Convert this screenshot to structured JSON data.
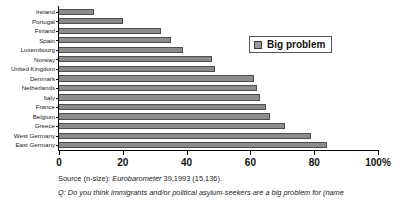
{
  "chart_data": {
    "type": "bar",
    "orientation": "horizontal",
    "title": "",
    "xlabel": "",
    "ylabel": "",
    "xlim": [
      0,
      100
    ],
    "xticks": [
      "0",
      "20",
      "40",
      "60",
      "80",
      "100%"
    ],
    "xtick_values": [
      0,
      20,
      40,
      60,
      80,
      100
    ],
    "grid": false,
    "legend_position": "upper right",
    "categories": [
      "Ireland",
      "Portugal",
      "Finland",
      "Spain",
      "Luxembourg",
      "Norway",
      "United Kingdom",
      "Denmark",
      "Netherlands",
      "Italy",
      "France",
      "Belgium",
      "Greece",
      "West Germany",
      "East Germany"
    ],
    "series": [
      {
        "name": "Big problem",
        "color": "#8c8c8c",
        "values": [
          11,
          20,
          32,
          35,
          39,
          48,
          49,
          61,
          62,
          63,
          65,
          66,
          71,
          79,
          84
        ]
      }
    ]
  },
  "legend": {
    "label": "Big problem",
    "swatch_color": "#9a9a9a"
  },
  "footer": {
    "source_prefix": "Source (n-size):",
    "source_italic": "Eurobarometer",
    "source_suffix": "39,1993 (15,136).",
    "source_full": "Source (n-size): Eurobarometer 39,1993 (15,136).",
    "question": "Q: Do you think immigrants and/or political asylum-seekers are a big problem for (name"
  }
}
